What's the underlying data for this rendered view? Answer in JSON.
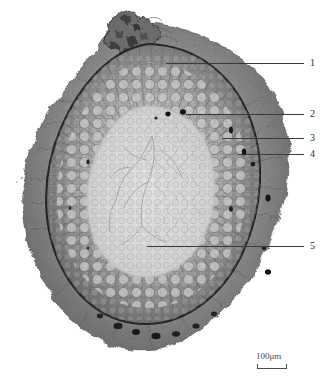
{
  "figure": {
    "kind": "light-micrograph",
    "background_color": "#ffffff",
    "tissue_colors": {
      "outer_flaky_layer": "#8c8c8c",
      "dark_boundary_ring": "#2a2a2a",
      "cortex_cells": "#9a9a9a",
      "ray_striations": "#6e6e6e",
      "pith_center": "#dcdcdc",
      "dark_inclusions": "#1a1a1a"
    }
  },
  "labels": [
    {
      "id": "1",
      "text": "1",
      "line_x1": 166,
      "line_x2": 304,
      "line_y": 63,
      "num_x": 310,
      "num_y": 58
    },
    {
      "id": "2",
      "text": "2",
      "line_x1": 186,
      "line_x2": 304,
      "line_y": 114,
      "num_x": 310,
      "num_y": 109
    },
    {
      "id": "3",
      "text": "3",
      "line_x1": 222,
      "line_x2": 304,
      "line_y": 138,
      "num_x": 310,
      "num_y": 133
    },
    {
      "id": "4",
      "text": "4",
      "line_x1": 238,
      "line_x2": 304,
      "line_y": 154,
      "num_x": 310,
      "num_y": 149
    },
    {
      "id": "5",
      "text": "5",
      "line_x1": 147,
      "line_x2": 304,
      "line_y": 246,
      "num_x": 310,
      "num_y": 241
    }
  ],
  "scalebar": {
    "label": "100μm",
    "value": "100",
    "unit": "μm"
  }
}
